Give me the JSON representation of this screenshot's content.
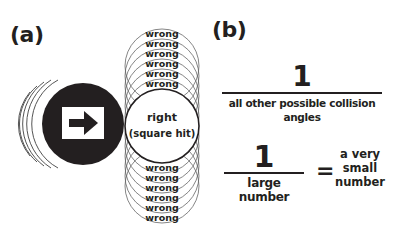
{
  "panel_a": {
    "label": "(a)",
    "center_label_line1": "right",
    "center_label_line2": "(square hit)",
    "wrong_label": "wrong",
    "wrong_above_count": 6,
    "wrong_below_count": 6,
    "object_icon": "right-arrow-icon"
  },
  "panel_b": {
    "label": "(b)",
    "fraction1": {
      "numerator": "1",
      "denominator": "all other possible collision angles"
    },
    "fraction2": {
      "numerator": "1",
      "denominator": "large number"
    },
    "equals": "=",
    "result": {
      "line1": "a very",
      "line2": "small",
      "line3": "number"
    }
  },
  "colors": {
    "ink": "#231f20",
    "background": "#ffffff",
    "thin_line": "#555555"
  }
}
